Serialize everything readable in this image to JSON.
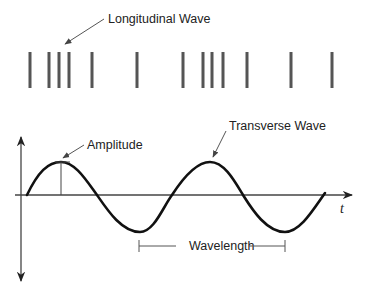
{
  "labels": {
    "longitudinal": "Longitudinal Wave",
    "transverse": "Transverse Wave",
    "amplitude": "Amplitude",
    "wavelength": "Wavelength",
    "time_axis": "t"
  },
  "colors": {
    "background": "#ffffff",
    "bars": "#555555",
    "wave": "#111111",
    "axis": "#444444",
    "annotation": "#555555",
    "text": "#222222"
  },
  "longitudinal_wave": {
    "bar_x_positions": [
      30,
      49,
      59,
      69,
      92,
      137,
      183,
      203,
      212,
      223,
      247,
      291,
      332
    ],
    "bar_top": 52,
    "bar_bottom": 88
  },
  "transverse_wave": {
    "axis_y": 195,
    "start_x": 27,
    "peaks": [
      [
        61,
        162
      ],
      [
        210,
        162
      ]
    ],
    "troughs": [
      [
        140,
        232
      ],
      [
        285,
        232
      ]
    ],
    "end_x": 325
  }
}
